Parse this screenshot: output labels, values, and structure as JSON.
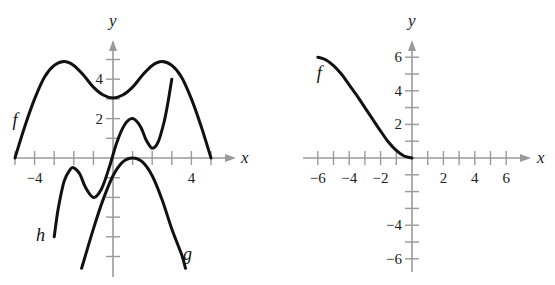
{
  "chart_data": [
    {
      "type": "line",
      "title": "",
      "xlabel": "x",
      "ylabel": "y",
      "xlim": [
        -5.2,
        5.9
      ],
      "ylim": [
        -6,
        6
      ],
      "x_ticks": [
        -5,
        -4,
        -3,
        -2,
        -1,
        1,
        2,
        3,
        4,
        5
      ],
      "y_ticks": [
        -5,
        -4,
        -3,
        -2,
        -1,
        1,
        2,
        3,
        4,
        5
      ],
      "x_tick_labels": [
        {
          "value": -4,
          "label": "−4"
        },
        {
          "value": 4,
          "label": "4"
        }
      ],
      "y_tick_labels": [
        {
          "value": 2,
          "label": "2"
        },
        {
          "value": 4,
          "label": "4"
        }
      ],
      "grid": false,
      "series": [
        {
          "name": "f",
          "label_at": [
            -5,
            1.6
          ],
          "x": [
            -5,
            -4.5,
            -4,
            -3.5,
            -3,
            -2.5,
            -2,
            -1.5,
            -1,
            -0.5,
            0,
            0.5,
            1,
            1.5,
            2,
            2.5,
            3,
            3.5,
            4,
            4.5,
            5
          ],
          "y": [
            0,
            1.6,
            3.0,
            4.1,
            4.7,
            4.9,
            4.7,
            4.2,
            3.6,
            3.2,
            3.05,
            3.2,
            3.6,
            4.2,
            4.7,
            4.9,
            4.7,
            4.1,
            3.0,
            1.6,
            0
          ]
        },
        {
          "name": "h",
          "label_at": [
            -3.7,
            -4.2
          ],
          "x": [
            -3,
            -2.8,
            -2.5,
            -2.2,
            -2,
            -1.7,
            -1.4,
            -1,
            -0.6,
            -0.2,
            0.2,
            0.6,
            1,
            1.4,
            1.7,
            2,
            2.3,
            2.6,
            2.8,
            3
          ],
          "y": [
            -4,
            -2.6,
            -1.2,
            -0.6,
            -0.5,
            -0.8,
            -1.5,
            -2.0,
            -1.6,
            -0.5,
            0.8,
            1.7,
            2.0,
            1.6,
            0.9,
            0.5,
            0.8,
            1.8,
            2.8,
            4.0
          ]
        },
        {
          "name": "g",
          "label_at": [
            3.8,
            -5.2
          ],
          "x": [
            -1.6,
            -1,
            -0.5,
            0,
            0.5,
            1,
            1.5,
            2,
            2.5,
            3,
            3.5,
            3.7
          ],
          "y": [
            -5.6,
            -3.6,
            -2.1,
            -0.9,
            -0.2,
            0,
            -0.2,
            -0.9,
            -2.1,
            -3.6,
            -4.9,
            -5.6
          ]
        }
      ]
    },
    {
      "type": "line",
      "title": "",
      "xlabel": "x",
      "ylabel": "y",
      "xlim": [
        -7,
        7.5
      ],
      "ylim": [
        -6.6,
        6.8
      ],
      "x_ticks": [
        -6,
        -5,
        -4,
        -3,
        -2,
        -1,
        1,
        2,
        3,
        4,
        5,
        6
      ],
      "y_ticks": [
        -6,
        -5,
        -4,
        -3,
        -2,
        -1,
        1,
        2,
        3,
        4,
        5,
        6
      ],
      "x_tick_labels": [
        {
          "value": -6,
          "label": "−6"
        },
        {
          "value": -4,
          "label": "−4"
        },
        {
          "value": -2,
          "label": "−2"
        },
        {
          "value": 2,
          "label": "2"
        },
        {
          "value": 4,
          "label": "4"
        },
        {
          "value": 6,
          "label": "6"
        }
      ],
      "y_tick_labels": [
        {
          "value": 6,
          "label": "6"
        },
        {
          "value": 4,
          "label": "4"
        },
        {
          "value": 2,
          "label": "2"
        },
        {
          "value": -4,
          "label": "−4"
        },
        {
          "value": -6,
          "label": "−6"
        }
      ],
      "grid": false,
      "series": [
        {
          "name": "f",
          "label_at": [
            -5.9,
            4.7
          ],
          "x": [
            -6,
            -5.5,
            -5,
            -4.5,
            -4,
            -3.5,
            -3,
            -2.5,
            -2,
            -1.5,
            -1,
            -0.5,
            0
          ],
          "y": [
            6,
            5.85,
            5.5,
            5.0,
            4.35,
            3.7,
            3.0,
            2.3,
            1.6,
            0.95,
            0.45,
            0.12,
            0
          ]
        }
      ]
    }
  ]
}
